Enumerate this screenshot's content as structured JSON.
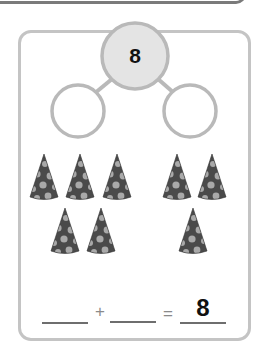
{
  "number_bond": {
    "whole": "8",
    "part_left": "",
    "part_right": ""
  },
  "objects": {
    "name": "party hats",
    "left_group_count": 5,
    "right_group_count": 3,
    "left_group": [
      {
        "x": 44,
        "y": 154
      },
      {
        "x": 80,
        "y": 154
      },
      {
        "x": 117,
        "y": 154
      },
      {
        "x": 65,
        "y": 208
      },
      {
        "x": 101,
        "y": 208
      }
    ],
    "right_group": [
      {
        "x": 177,
        "y": 154
      },
      {
        "x": 212,
        "y": 154
      },
      {
        "x": 193,
        "y": 208
      }
    ]
  },
  "equation": {
    "addend_1": "",
    "plus": "+",
    "addend_2": "",
    "equals": "=",
    "sum": "8"
  },
  "colors": {
    "circle_fill_whole": "#e4e4e4",
    "circle_stroke": "#b9b9b9",
    "card_border": "#c4c4c4",
    "hat_body": "#4a4a4a",
    "hat_dots": "#a9a9a9"
  }
}
